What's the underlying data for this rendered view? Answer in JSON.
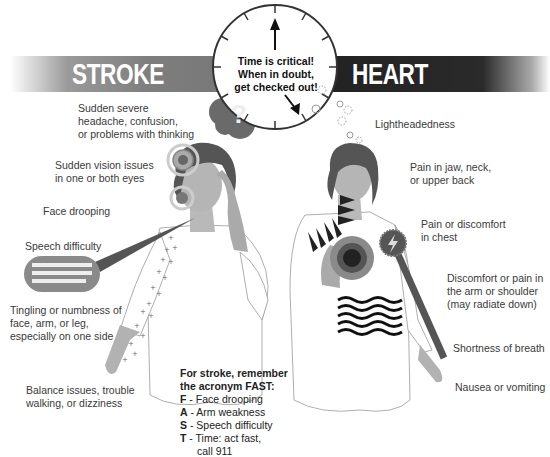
{
  "banners": {
    "stroke": "STROKE",
    "heart_attack": "HEART ATTACK"
  },
  "clock": {
    "lines": [
      "Time is critical!",
      "When in  doubt,",
      "get checked out!"
    ]
  },
  "stroke_symptoms": [
    {
      "lines": [
        "Sudden severe",
        "headache, confusion,",
        "or problems with thinking"
      ]
    },
    {
      "lines": [
        "Sudden vision issues",
        "in one or both eyes"
      ]
    },
    {
      "lines": [
        "Face drooping"
      ]
    },
    {
      "lines": [
        "Speech difficulty"
      ]
    },
    {
      "lines": [
        "Tingling or numbness of",
        "face, arm, or leg,",
        "especially on one side"
      ]
    },
    {
      "lines": [
        "Balance issues, trouble",
        "walking, or dizziness"
      ]
    }
  ],
  "heart_symptoms": [
    {
      "lines": [
        "Lightheadedness"
      ]
    },
    {
      "lines": [
        "Pain in jaw, neck,",
        "or upper back"
      ]
    },
    {
      "lines": [
        "Pain or discomfort",
        "in chest"
      ]
    },
    {
      "lines": [
        "Discomfort or pain in",
        "the arm or shoulder",
        "(may radiate down)"
      ]
    },
    {
      "lines": [
        "Shortness of breath"
      ]
    },
    {
      "lines": [
        "Nausea or vomiting"
      ]
    }
  ],
  "fast": {
    "title_1": "For stroke, remember",
    "title_2": "the acronym FAST:",
    "items": [
      {
        "letter": "F",
        "text": " - Face drooping"
      },
      {
        "letter": "A",
        "text": " - Arm weakness"
      },
      {
        "letter": "S",
        "text": " - Speech difficulty"
      },
      {
        "letter": "T",
        "text": " - Time: act fast,"
      }
    ],
    "continuation": "call 911"
  },
  "icons": {
    "question": "?"
  },
  "colors": {
    "stroke_banner": "#7e7e7e",
    "heart_banner": "#222222",
    "text": "#3a3a3a"
  }
}
